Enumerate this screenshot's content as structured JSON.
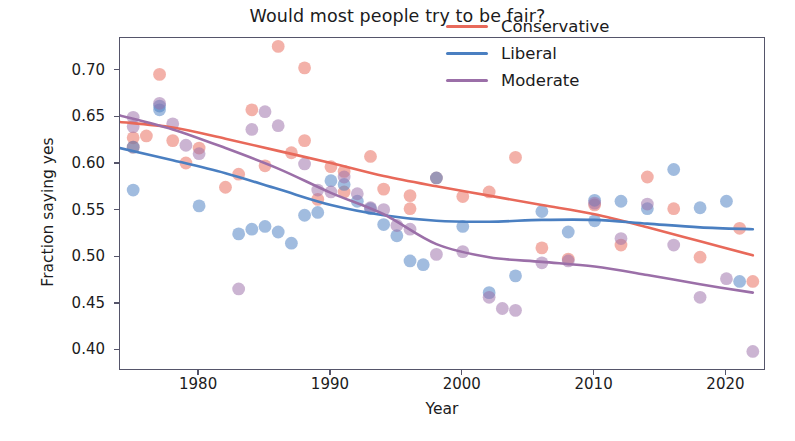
{
  "chart_data": {
    "type": "scatter",
    "title": "Would most people try to be fair?",
    "xlabel": "Year",
    "ylabel": "Fraction saying yes",
    "xlim": [
      1974,
      2023
    ],
    "ylim": [
      0.378,
      0.735
    ],
    "xticks": [
      1980,
      1990,
      2000,
      2010,
      2020
    ],
    "yticks": [
      0.4,
      0.45,
      0.5,
      0.55,
      0.6,
      0.65,
      0.7
    ],
    "ytick_labels": [
      "0.40",
      "0.45",
      "0.50",
      "0.55",
      "0.60",
      "0.65",
      "0.70"
    ],
    "xtick_labels": [
      "1980",
      "1990",
      "2000",
      "2010",
      "2020"
    ],
    "grid": false,
    "legend_position": "upper right",
    "colors": {
      "conservative": "#e8695a",
      "liberal": "#4a7fc1",
      "moderate": "#9b6fa8",
      "axis": "#55556a",
      "text": "#1b1b20",
      "background": "#ffffff"
    },
    "legend": [
      {
        "name": "Conservative",
        "color": "#e8695a"
      },
      {
        "name": "Liberal",
        "color": "#4a7fc1"
      },
      {
        "name": "Moderate",
        "color": "#9b6fa8"
      }
    ],
    "series": [
      {
        "name": "Conservative",
        "color": "#e8695a",
        "points": [
          [
            1975,
            0.628
          ],
          [
            1975,
            0.618
          ],
          [
            1976,
            0.63
          ],
          [
            1977,
            0.696
          ],
          [
            1978,
            0.625
          ],
          [
            1979,
            0.601
          ],
          [
            1980,
            0.617
          ],
          [
            1982,
            0.575
          ],
          [
            1983,
            0.589
          ],
          [
            1984,
            0.658
          ],
          [
            1985,
            0.598
          ],
          [
            1986,
            0.726
          ],
          [
            1987,
            0.612
          ],
          [
            1988,
            0.703
          ],
          [
            1988,
            0.625
          ],
          [
            1989,
            0.562
          ],
          [
            1990,
            0.597
          ],
          [
            1991,
            0.592
          ],
          [
            1991,
            0.57
          ],
          [
            1993,
            0.608
          ],
          [
            1994,
            0.573
          ],
          [
            1996,
            0.566
          ],
          [
            1996,
            0.552
          ],
          [
            1998,
            0.585
          ],
          [
            2000,
            0.565
          ],
          [
            2002,
            0.57
          ],
          [
            2004,
            0.607
          ],
          [
            2006,
            0.51
          ],
          [
            2008,
            0.498
          ],
          [
            2010,
            0.556
          ],
          [
            2012,
            0.513
          ],
          [
            2014,
            0.586
          ],
          [
            2016,
            0.552
          ],
          [
            2018,
            0.5
          ],
          [
            2021,
            0.531
          ],
          [
            2022,
            0.474
          ]
        ],
        "trend_curve": [
          [
            1974,
            0.645
          ],
          [
            1978,
            0.639
          ],
          [
            1982,
            0.627
          ],
          [
            1986,
            0.614
          ],
          [
            1990,
            0.601
          ],
          [
            1994,
            0.587
          ],
          [
            1998,
            0.576
          ],
          [
            2002,
            0.566
          ],
          [
            2006,
            0.556
          ],
          [
            2010,
            0.546
          ],
          [
            2014,
            0.532
          ],
          [
            2018,
            0.517
          ],
          [
            2022,
            0.502
          ]
        ]
      },
      {
        "name": "Liberal",
        "color": "#4a7fc1",
        "points": [
          [
            1975,
            0.618
          ],
          [
            1975,
            0.572
          ],
          [
            1977,
            0.662
          ],
          [
            1977,
            0.658
          ],
          [
            1980,
            0.555
          ],
          [
            1983,
            0.525
          ],
          [
            1984,
            0.53
          ],
          [
            1985,
            0.533
          ],
          [
            1986,
            0.527
          ],
          [
            1987,
            0.515
          ],
          [
            1988,
            0.545
          ],
          [
            1989,
            0.548
          ],
          [
            1990,
            0.582
          ],
          [
            1991,
            0.578
          ],
          [
            1992,
            0.56
          ],
          [
            1993,
            0.552
          ],
          [
            1994,
            0.535
          ],
          [
            1995,
            0.523
          ],
          [
            1996,
            0.496
          ],
          [
            1997,
            0.492
          ],
          [
            1998,
            0.585
          ],
          [
            2000,
            0.533
          ],
          [
            2002,
            0.462
          ],
          [
            2004,
            0.48
          ],
          [
            2006,
            0.549
          ],
          [
            2008,
            0.527
          ],
          [
            2010,
            0.539
          ],
          [
            2010,
            0.561
          ],
          [
            2012,
            0.56
          ],
          [
            2014,
            0.552
          ],
          [
            2016,
            0.594
          ],
          [
            2018,
            0.553
          ],
          [
            2020,
            0.56
          ],
          [
            2021,
            0.474
          ]
        ],
        "trend_curve": [
          [
            1974,
            0.617
          ],
          [
            1978,
            0.604
          ],
          [
            1982,
            0.59
          ],
          [
            1986,
            0.573
          ],
          [
            1990,
            0.556
          ],
          [
            1994,
            0.545
          ],
          [
            1998,
            0.539
          ],
          [
            2002,
            0.538
          ],
          [
            2006,
            0.54
          ],
          [
            2010,
            0.54
          ],
          [
            2014,
            0.536
          ],
          [
            2018,
            0.532
          ],
          [
            2022,
            0.53
          ]
        ]
      },
      {
        "name": "Moderate",
        "color": "#9b6fa8",
        "points": [
          [
            1975,
            0.65
          ],
          [
            1975,
            0.64
          ],
          [
            1977,
            0.665
          ],
          [
            1978,
            0.643
          ],
          [
            1979,
            0.62
          ],
          [
            1980,
            0.611
          ],
          [
            1983,
            0.466
          ],
          [
            1984,
            0.637
          ],
          [
            1985,
            0.656
          ],
          [
            1986,
            0.641
          ],
          [
            1988,
            0.6
          ],
          [
            1989,
            0.572
          ],
          [
            1990,
            0.57
          ],
          [
            1991,
            0.586
          ],
          [
            1992,
            0.568
          ],
          [
            1993,
            0.553
          ],
          [
            1994,
            0.551
          ],
          [
            1995,
            0.534
          ],
          [
            1996,
            0.53
          ],
          [
            1998,
            0.503
          ],
          [
            2000,
            0.506
          ],
          [
            2002,
            0.457
          ],
          [
            2003,
            0.445
          ],
          [
            2004,
            0.443
          ],
          [
            2006,
            0.494
          ],
          [
            2008,
            0.496
          ],
          [
            2010,
            0.558
          ],
          [
            2012,
            0.52
          ],
          [
            2014,
            0.557
          ],
          [
            2016,
            0.513
          ],
          [
            2018,
            0.457
          ],
          [
            2020,
            0.477
          ],
          [
            2022,
            0.399
          ]
        ],
        "trend_curve": [
          [
            1974,
            0.652
          ],
          [
            1978,
            0.637
          ],
          [
            1982,
            0.617
          ],
          [
            1986,
            0.595
          ],
          [
            1990,
            0.569
          ],
          [
            1994,
            0.546
          ],
          [
            1998,
            0.514
          ],
          [
            2002,
            0.5
          ],
          [
            2006,
            0.495
          ],
          [
            2010,
            0.49
          ],
          [
            2014,
            0.481
          ],
          [
            2018,
            0.471
          ],
          [
            2022,
            0.462
          ]
        ]
      }
    ]
  }
}
